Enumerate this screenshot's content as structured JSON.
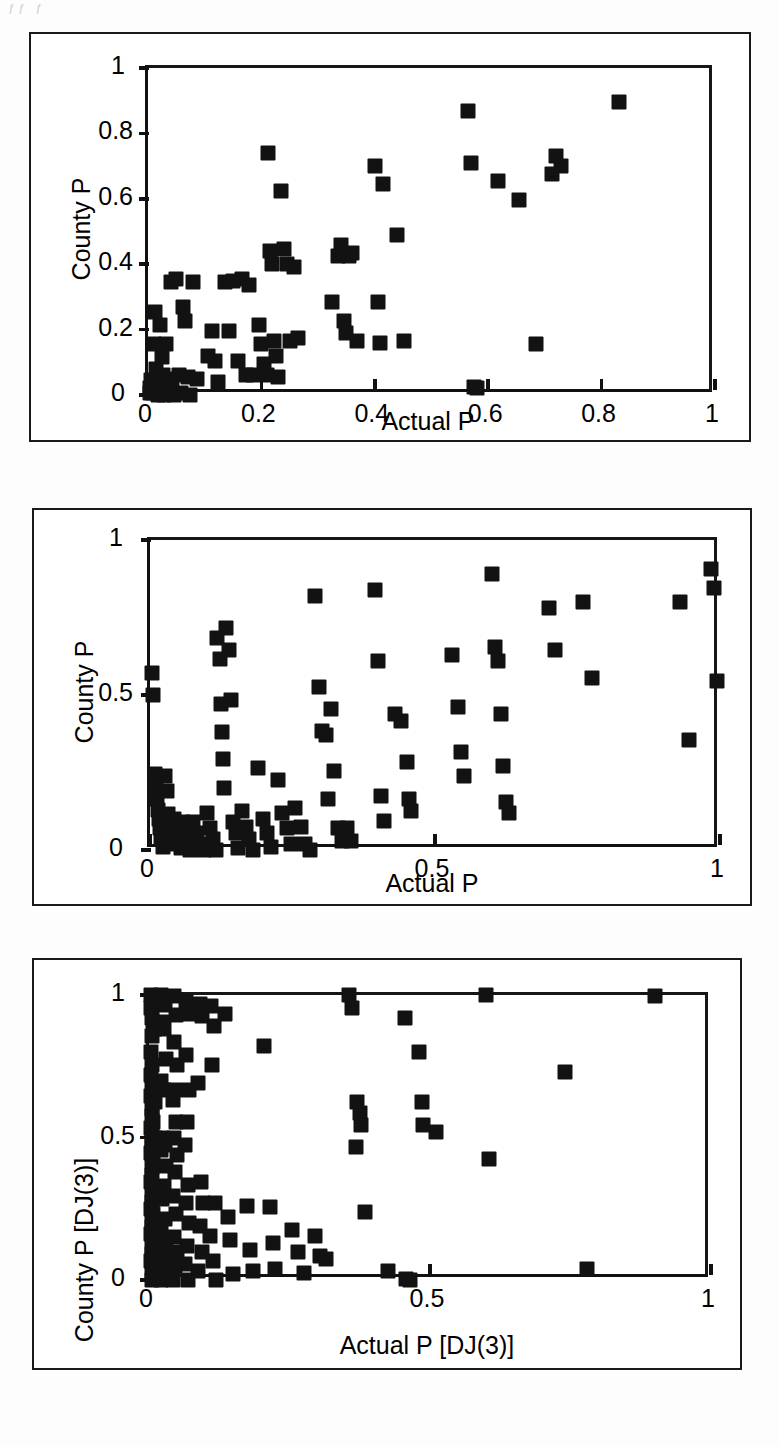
{
  "page": {
    "scan_artifact_text": "ƒƒ  ƒ",
    "background_color": "#ffffff",
    "ink_color": "#121212"
  },
  "chart_data": [
    {
      "panel_id": "panel-top",
      "type": "scatter",
      "title": "",
      "xlabel": "Actual P",
      "ylabel": "County P",
      "xlim": [
        0,
        1
      ],
      "ylim": [
        0,
        1
      ],
      "grid": false,
      "legend": null,
      "xticks": [
        0,
        0.2,
        0.4,
        0.6,
        0.8,
        1
      ],
      "xticklabels": [
        "0",
        "0.2",
        "0.4",
        "0.6",
        "0.8",
        "1"
      ],
      "yticks": [
        0,
        0.2,
        0.4,
        0.6,
        0.8,
        1
      ],
      "yticklabels": [
        "0",
        "0.2",
        "0.4",
        "0.6",
        "0.8",
        "1"
      ],
      "marker": "square",
      "marker_color": "#121212",
      "points": [
        [
          0.003,
          0.005
        ],
        [
          0.004,
          0.02
        ],
        [
          0.006,
          0.045
        ],
        [
          0.008,
          0.005
        ],
        [
          0.01,
          0.155
        ],
        [
          0.012,
          0.255
        ],
        [
          0.014,
          0.08
        ],
        [
          0.016,
          0.03
        ],
        [
          0.018,
          0.0
        ],
        [
          0.022,
          0.215
        ],
        [
          0.024,
          0.115
        ],
        [
          0.026,
          0.06
        ],
        [
          0.028,
          0.0
        ],
        [
          0.032,
          0.155
        ],
        [
          0.034,
          0.04
        ],
        [
          0.036,
          0.005
        ],
        [
          0.04,
          0.345
        ],
        [
          0.043,
          0.05
        ],
        [
          0.046,
          0.0
        ],
        [
          0.05,
          0.355
        ],
        [
          0.054,
          0.06
        ],
        [
          0.058,
          0.005
        ],
        [
          0.062,
          0.27
        ],
        [
          0.066,
          0.225
        ],
        [
          0.07,
          0.055
        ],
        [
          0.074,
          0.0
        ],
        [
          0.08,
          0.345
        ],
        [
          0.086,
          0.05
        ],
        [
          0.105,
          0.12
        ],
        [
          0.112,
          0.195
        ],
        [
          0.118,
          0.105
        ],
        [
          0.124,
          0.04
        ],
        [
          0.135,
          0.345
        ],
        [
          0.142,
          0.195
        ],
        [
          0.15,
          0.35
        ],
        [
          0.158,
          0.105
        ],
        [
          0.165,
          0.355
        ],
        [
          0.172,
          0.06
        ],
        [
          0.178,
          0.335
        ],
        [
          0.185,
          0.06
        ],
        [
          0.195,
          0.215
        ],
        [
          0.2,
          0.155
        ],
        [
          0.205,
          0.095
        ],
        [
          0.21,
          0.06
        ],
        [
          0.212,
          0.74
        ],
        [
          0.215,
          0.44
        ],
        [
          0.218,
          0.4
        ],
        [
          0.222,
          0.165
        ],
        [
          0.226,
          0.12
        ],
        [
          0.23,
          0.055
        ],
        [
          0.235,
          0.625
        ],
        [
          0.24,
          0.445
        ],
        [
          0.245,
          0.4
        ],
        [
          0.25,
          0.165
        ],
        [
          0.258,
          0.39
        ],
        [
          0.265,
          0.175
        ],
        [
          0.325,
          0.285
        ],
        [
          0.335,
          0.425
        ],
        [
          0.34,
          0.46
        ],
        [
          0.345,
          0.225
        ],
        [
          0.35,
          0.19
        ],
        [
          0.355,
          0.425
        ],
        [
          0.36,
          0.435
        ],
        [
          0.368,
          0.165
        ],
        [
          0.4,
          0.7
        ],
        [
          0.405,
          0.285
        ],
        [
          0.41,
          0.16
        ],
        [
          0.415,
          0.645
        ],
        [
          0.44,
          0.49
        ],
        [
          0.452,
          0.165
        ],
        [
          0.565,
          0.87
        ],
        [
          0.57,
          0.71
        ],
        [
          0.575,
          0.025
        ],
        [
          0.58,
          0.02
        ],
        [
          0.618,
          0.655
        ],
        [
          0.655,
          0.595
        ],
        [
          0.685,
          0.155
        ],
        [
          0.712,
          0.675
        ],
        [
          0.72,
          0.73
        ],
        [
          0.728,
          0.7
        ],
        [
          0.83,
          0.895
        ]
      ]
    },
    {
      "panel_id": "panel-middle",
      "type": "scatter",
      "title": "",
      "xlabel": "Actual P",
      "ylabel": "County P",
      "xlim": [
        0,
        1
      ],
      "ylim": [
        0,
        1
      ],
      "grid": false,
      "legend": null,
      "xticks": [
        0,
        0.5,
        1
      ],
      "xticklabels": [
        "0",
        "0.5",
        "1"
      ],
      "yticks": [
        0,
        0.5,
        1
      ],
      "yticklabels": [
        "0",
        "0.5",
        "1"
      ],
      "marker": "square",
      "marker_color": "#121212",
      "points": [
        [
          0.004,
          0.57
        ],
        [
          0.006,
          0.5
        ],
        [
          0.008,
          0.245
        ],
        [
          0.01,
          0.21
        ],
        [
          0.012,
          0.165
        ],
        [
          0.014,
          0.13
        ],
        [
          0.016,
          0.1
        ],
        [
          0.018,
          0.07
        ],
        [
          0.02,
          0.04
        ],
        [
          0.022,
          0.01
        ],
        [
          0.026,
          0.24
        ],
        [
          0.03,
          0.19
        ],
        [
          0.032,
          0.115
        ],
        [
          0.034,
          0.08
        ],
        [
          0.036,
          0.05
        ],
        [
          0.038,
          0.02
        ],
        [
          0.042,
          0.1
        ],
        [
          0.046,
          0.065
        ],
        [
          0.05,
          0.03
        ],
        [
          0.054,
          0.005
        ],
        [
          0.058,
          0.09
        ],
        [
          0.062,
          0.055
        ],
        [
          0.066,
          0.02
        ],
        [
          0.07,
          0.0
        ],
        [
          0.076,
          0.09
        ],
        [
          0.082,
          0.055
        ],
        [
          0.088,
          0.02
        ],
        [
          0.094,
          0.0
        ],
        [
          0.1,
          0.12
        ],
        [
          0.106,
          0.07
        ],
        [
          0.11,
          0.035
        ],
        [
          0.115,
          0.0
        ],
        [
          0.118,
          0.685
        ],
        [
          0.122,
          0.615
        ],
        [
          0.124,
          0.47
        ],
        [
          0.126,
          0.38
        ],
        [
          0.128,
          0.295
        ],
        [
          0.13,
          0.2
        ],
        [
          0.134,
          0.715
        ],
        [
          0.138,
          0.645
        ],
        [
          0.142,
          0.485
        ],
        [
          0.146,
          0.09
        ],
        [
          0.15,
          0.055
        ],
        [
          0.155,
          0.005
        ],
        [
          0.162,
          0.125
        ],
        [
          0.168,
          0.075
        ],
        [
          0.174,
          0.035
        ],
        [
          0.18,
          0.0
        ],
        [
          0.19,
          0.265
        ],
        [
          0.198,
          0.1
        ],
        [
          0.205,
          0.055
        ],
        [
          0.212,
          0.01
        ],
        [
          0.225,
          0.225
        ],
        [
          0.232,
          0.12
        ],
        [
          0.24,
          0.07
        ],
        [
          0.248,
          0.02
        ],
        [
          0.255,
          0.135
        ],
        [
          0.265,
          0.075
        ],
        [
          0.272,
          0.02
        ],
        [
          0.28,
          0.0
        ],
        [
          0.29,
          0.82
        ],
        [
          0.296,
          0.525
        ],
        [
          0.302,
          0.385
        ],
        [
          0.308,
          0.37
        ],
        [
          0.312,
          0.165
        ],
        [
          0.318,
          0.455
        ],
        [
          0.322,
          0.255
        ],
        [
          0.33,
          0.07
        ],
        [
          0.336,
          0.03
        ],
        [
          0.345,
          0.07
        ],
        [
          0.352,
          0.03
        ],
        [
          0.395,
          0.84
        ],
        [
          0.4,
          0.61
        ],
        [
          0.405,
          0.175
        ],
        [
          0.41,
          0.095
        ],
        [
          0.43,
          0.44
        ],
        [
          0.44,
          0.415
        ],
        [
          0.45,
          0.285
        ],
        [
          0.455,
          0.165
        ],
        [
          0.458,
          0.125
        ],
        [
          0.53,
          0.63
        ],
        [
          0.54,
          0.46
        ],
        [
          0.545,
          0.315
        ],
        [
          0.55,
          0.24
        ],
        [
          0.6,
          0.89
        ],
        [
          0.605,
          0.655
        ],
        [
          0.61,
          0.61
        ],
        [
          0.615,
          0.44
        ],
        [
          0.62,
          0.27
        ],
        [
          0.625,
          0.155
        ],
        [
          0.63,
          0.12
        ],
        [
          0.7,
          0.78
        ],
        [
          0.71,
          0.645
        ],
        [
          0.76,
          0.8
        ],
        [
          0.775,
          0.555
        ],
        [
          0.93,
          0.8
        ],
        [
          0.945,
          0.355
        ],
        [
          0.985,
          0.905
        ],
        [
          0.99,
          0.845
        ],
        [
          0.995,
          0.545
        ]
      ]
    },
    {
      "panel_id": "panel-bottom",
      "type": "scatter",
      "title": "",
      "xlabel": "Actual P [DJ(3)]",
      "ylabel": "County P [DJ(3)]",
      "xlim": [
        0,
        1
      ],
      "ylim": [
        0,
        1
      ],
      "grid": false,
      "legend": null,
      "xticks": [
        0,
        0.5,
        1
      ],
      "xticklabels": [
        "0",
        "0.5",
        "1"
      ],
      "yticks": [
        0,
        0.5,
        1
      ],
      "yticklabels": [
        "0",
        "0.5",
        "1"
      ],
      "marker": "square",
      "marker_color": "#121212",
      "points": [
        [
          0.004,
          1.0
        ],
        [
          0.008,
          0.995
        ],
        [
          0.012,
          0.985
        ],
        [
          0.004,
          0.955
        ],
        [
          0.006,
          0.92
        ],
        [
          0.008,
          0.905
        ],
        [
          0.01,
          0.88
        ],
        [
          0.006,
          0.855
        ],
        [
          0.004,
          0.8
        ],
        [
          0.006,
          0.755
        ],
        [
          0.004,
          0.72
        ],
        [
          0.006,
          0.69
        ],
        [
          0.008,
          0.665
        ],
        [
          0.004,
          0.645
        ],
        [
          0.01,
          0.625
        ],
        [
          0.005,
          0.6
        ],
        [
          0.006,
          0.575
        ],
        [
          0.008,
          0.555
        ],
        [
          0.004,
          0.535
        ],
        [
          0.006,
          0.515
        ],
        [
          0.01,
          0.5
        ],
        [
          0.005,
          0.485
        ],
        [
          0.006,
          0.465
        ],
        [
          0.004,
          0.445
        ],
        [
          0.008,
          0.42
        ],
        [
          0.005,
          0.395
        ],
        [
          0.006,
          0.37
        ],
        [
          0.004,
          0.345
        ],
        [
          0.008,
          0.325
        ],
        [
          0.005,
          0.3
        ],
        [
          0.006,
          0.275
        ],
        [
          0.004,
          0.25
        ],
        [
          0.008,
          0.23
        ],
        [
          0.005,
          0.205
        ],
        [
          0.006,
          0.185
        ],
        [
          0.004,
          0.16
        ],
        [
          0.01,
          0.14
        ],
        [
          0.005,
          0.115
        ],
        [
          0.006,
          0.09
        ],
        [
          0.004,
          0.065
        ],
        [
          0.008,
          0.04
        ],
        [
          0.005,
          0.02
        ],
        [
          0.006,
          0.0
        ],
        [
          0.022,
          1.0
        ],
        [
          0.028,
          0.965
        ],
        [
          0.024,
          0.905
        ],
        [
          0.026,
          0.88
        ],
        [
          0.03,
          0.775
        ],
        [
          0.022,
          0.7
        ],
        [
          0.026,
          0.665
        ],
        [
          0.024,
          0.5
        ],
        [
          0.028,
          0.475
        ],
        [
          0.022,
          0.455
        ],
        [
          0.03,
          0.4
        ],
        [
          0.026,
          0.33
        ],
        [
          0.024,
          0.285
        ],
        [
          0.028,
          0.215
        ],
        [
          0.022,
          0.175
        ],
        [
          0.03,
          0.14
        ],
        [
          0.026,
          0.09
        ],
        [
          0.024,
          0.055
        ],
        [
          0.028,
          0.02
        ],
        [
          0.022,
          0.0
        ],
        [
          0.045,
          0.995
        ],
        [
          0.048,
          0.93
        ],
        [
          0.044,
          0.835
        ],
        [
          0.05,
          0.755
        ],
        [
          0.046,
          0.665
        ],
        [
          0.042,
          0.63
        ],
        [
          0.048,
          0.555
        ],
        [
          0.044,
          0.5
        ],
        [
          0.05,
          0.44
        ],
        [
          0.046,
          0.38
        ],
        [
          0.042,
          0.295
        ],
        [
          0.048,
          0.23
        ],
        [
          0.044,
          0.15
        ],
        [
          0.05,
          0.1
        ],
        [
          0.046,
          0.05
        ],
        [
          0.042,
          0.0
        ],
        [
          0.065,
          0.98
        ],
        [
          0.07,
          0.935
        ],
        [
          0.066,
          0.79
        ],
        [
          0.072,
          0.665
        ],
        [
          0.068,
          0.555
        ],
        [
          0.064,
          0.475
        ],
        [
          0.07,
          0.335
        ],
        [
          0.066,
          0.27
        ],
        [
          0.072,
          0.2
        ],
        [
          0.068,
          0.12
        ],
        [
          0.064,
          0.055
        ],
        [
          0.07,
          0.0
        ],
        [
          0.09,
          0.97
        ],
        [
          0.095,
          0.925
        ],
        [
          0.088,
          0.69
        ],
        [
          0.092,
          0.345
        ],
        [
          0.096,
          0.27
        ],
        [
          0.09,
          0.19
        ],
        [
          0.094,
          0.1
        ],
        [
          0.088,
          0.03
        ],
        [
          0.11,
          0.96
        ],
        [
          0.115,
          0.89
        ],
        [
          0.112,
          0.755
        ],
        [
          0.118,
          0.27
        ],
        [
          0.108,
          0.155
        ],
        [
          0.114,
          0.065
        ],
        [
          0.12,
          0.0
        ],
        [
          0.135,
          0.935
        ],
        [
          0.14,
          0.22
        ],
        [
          0.145,
          0.14
        ],
        [
          0.15,
          0.02
        ],
        [
          0.175,
          0.26
        ],
        [
          0.18,
          0.105
        ],
        [
          0.185,
          0.03
        ],
        [
          0.205,
          0.82
        ],
        [
          0.215,
          0.255
        ],
        [
          0.22,
          0.13
        ],
        [
          0.225,
          0.04
        ],
        [
          0.255,
          0.175
        ],
        [
          0.265,
          0.1
        ],
        [
          0.275,
          0.025
        ],
        [
          0.295,
          0.155
        ],
        [
          0.305,
          0.085
        ],
        [
          0.315,
          0.075
        ],
        [
          0.355,
          1.0
        ],
        [
          0.362,
          0.955
        ],
        [
          0.37,
          0.625
        ],
        [
          0.375,
          0.585
        ],
        [
          0.378,
          0.545
        ],
        [
          0.368,
          0.465
        ],
        [
          0.385,
          0.24
        ],
        [
          0.425,
          0.03
        ],
        [
          0.455,
          0.92
        ],
        [
          0.458,
          0.005
        ],
        [
          0.465,
          0.0
        ],
        [
          0.48,
          0.8
        ],
        [
          0.485,
          0.625
        ],
        [
          0.488,
          0.545
        ],
        [
          0.51,
          0.52
        ],
        [
          0.6,
          1.0
        ],
        [
          0.605,
          0.425
        ],
        [
          0.74,
          0.73
        ],
        [
          0.78,
          0.04
        ],
        [
          0.9,
          0.995
        ]
      ]
    }
  ]
}
